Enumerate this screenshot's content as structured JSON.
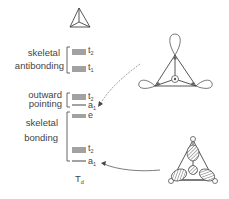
{
  "diagram": {
    "type": "molecular-orbital-energy-level-diagram",
    "point_group": {
      "main": "T",
      "sub": "d"
    },
    "groups": [
      {
        "label_lines": [
          "skeletal",
          "antibonding"
        ],
        "levels": [
          {
            "symbol": "t",
            "sub": "2",
            "degeneracy": 3
          },
          {
            "symbol": "t",
            "sub": "1",
            "degeneracy": 3
          }
        ]
      },
      {
        "label_lines": [
          "outward",
          "pointing"
        ],
        "levels": [
          {
            "symbol": "t",
            "sub": "2",
            "degeneracy": 3
          },
          {
            "symbol": "a",
            "sub": "1",
            "degeneracy": 1
          }
        ]
      },
      {
        "label_lines": [
          "skeletal",
          "bonding"
        ],
        "levels": [
          {
            "symbol": "e",
            "sub": "",
            "degeneracy": 2
          },
          {
            "symbol": "t",
            "sub": "2",
            "degeneracy": 3
          },
          {
            "symbol": "a",
            "sub": "1",
            "degeneracy": 1
          }
        ]
      }
    ],
    "illustrations": [
      {
        "name": "tetrahedron-skeleton",
        "description": "tetrahedral cluster framework"
      },
      {
        "name": "outward-pointing-a1-orbital",
        "description": "outward-pointing lobes on each vertex",
        "arrow_to": "outward-pointing a1"
      },
      {
        "name": "skeletal-bonding-a1-orbital",
        "description": "inward-pointing hatched lobes",
        "arrow_to": "skeletal bonding a1"
      }
    ]
  }
}
